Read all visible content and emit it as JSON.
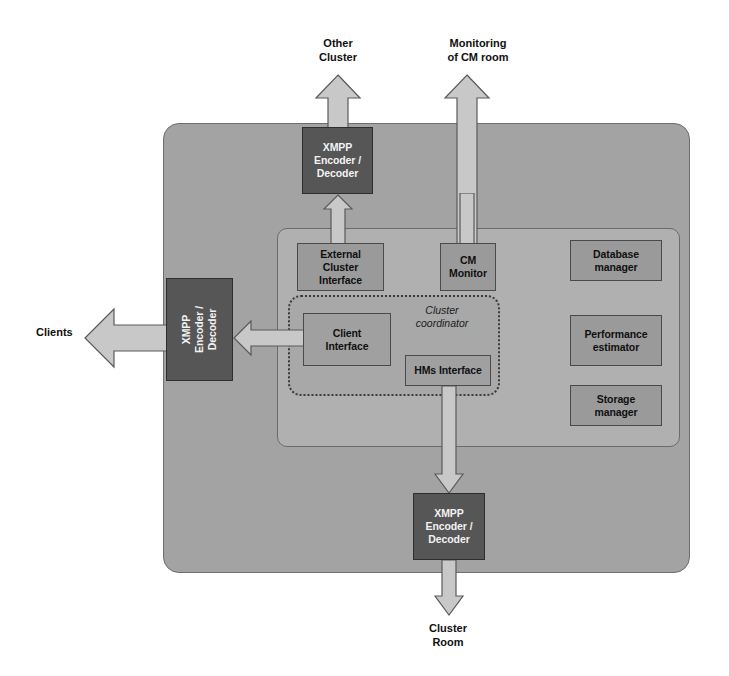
{
  "diagram": {
    "colors": {
      "outer_container": "#a3a3a3",
      "inner_container": "#b0b0b0",
      "coordinator_region": "#a8a8a8",
      "dark_box": "#565656",
      "light_box": "#9a9a9a",
      "arrow_fill": "#c8c8c8",
      "arrow_stroke": "#5a5a5a",
      "text_dark": "#101010",
      "text_light": "#f2f2f2"
    },
    "external_labels": {
      "other_cluster": "Other\nCluster",
      "other_cluster_line1": "Other",
      "other_cluster_line2": "Cluster",
      "monitoring_line1": "Monitoring",
      "monitoring_line2": "of CM room",
      "clients": "Clients",
      "cluster_room_line1": "Cluster",
      "cluster_room_line2": "Room"
    },
    "coordinator": {
      "label_line1": "Cluster",
      "label_line2": "coordinator",
      "style": "dotted-border italic label"
    },
    "gateways": [
      {
        "name": "xmpp-encoder-decoder-top",
        "line1": "XMPP",
        "line2": "Encoder /",
        "line3": "Decoder",
        "orientation": "horizontal",
        "connects": "Other Cluster"
      },
      {
        "name": "xmpp-encoder-decoder-left",
        "line1": "XMPP",
        "line2": "Encoder /",
        "line3": "Decoder",
        "vertical_text": "XMPP Encoder / Decoder",
        "orientation": "vertical",
        "connects": "Clients"
      },
      {
        "name": "xmpp-encoder-decoder-bottom",
        "line1": "XMPP",
        "line2": "Encoder /",
        "line3": "Decoder",
        "orientation": "horizontal",
        "connects": "Cluster Room"
      }
    ],
    "modules": [
      {
        "name": "external-cluster-interface",
        "line1": "External",
        "line2": "Cluster",
        "line3": "Interface"
      },
      {
        "name": "cm-monitor",
        "line1": "CM",
        "line2": "Monitor",
        "line3": ""
      },
      {
        "name": "database-manager",
        "line1": "Database",
        "line2": "manager",
        "line3": ""
      },
      {
        "name": "performance-estimator",
        "line1": "Performance",
        "line2": "estimator",
        "line3": ""
      },
      {
        "name": "storage-manager",
        "line1": "Storage",
        "line2": "manager",
        "line3": ""
      },
      {
        "name": "client-interface",
        "line1": "Client",
        "line2": "Interface",
        "line3": ""
      },
      {
        "name": "hms-interface",
        "line1": "HMs Interface",
        "line2": "",
        "line3": ""
      }
    ],
    "flows": [
      {
        "name": "other-cluster-up-arrow",
        "direction": "up",
        "from": "xmpp-encoder-decoder-top",
        "to": "Other Cluster"
      },
      {
        "name": "monitoring-up-arrow",
        "direction": "up",
        "from": "cm-monitor",
        "to": "Monitoring of CM room"
      },
      {
        "name": "external-cluster-to-xmpp-arrow",
        "direction": "up",
        "from": "external-cluster-interface",
        "to": "xmpp-encoder-decoder-top"
      },
      {
        "name": "clients-out-arrow",
        "direction": "left",
        "from": "xmpp-encoder-decoder-left",
        "to": "Clients"
      },
      {
        "name": "client-interface-to-xmpp-arrow",
        "direction": "left",
        "from": "client-interface",
        "to": "xmpp-encoder-decoder-left"
      },
      {
        "name": "hms-interface-down-arrow",
        "direction": "down",
        "from": "hms-interface",
        "to": "xmpp-encoder-decoder-bottom"
      },
      {
        "name": "cluster-room-down-arrow",
        "direction": "down",
        "from": "xmpp-encoder-decoder-bottom",
        "to": "Cluster Room"
      }
    ]
  }
}
